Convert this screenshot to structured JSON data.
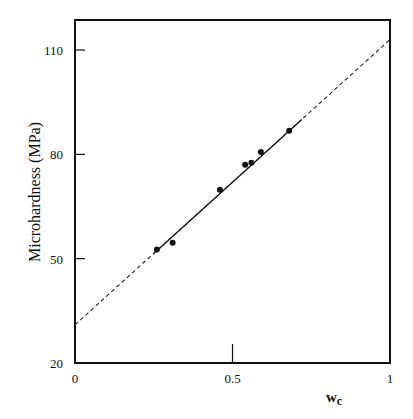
{
  "chart_data": {
    "type": "scatter",
    "title": "",
    "xlabel": "w",
    "xlabel_subscript": "c",
    "ylabel": "Microhardness (MPa)",
    "xlim": [
      0,
      1
    ],
    "ylim": [
      20,
      120
    ],
    "x_ticks": [
      {
        "value": 0,
        "label": "0"
      },
      {
        "value": 0.5,
        "label": "0.5"
      },
      {
        "value": 1,
        "label": "1"
      }
    ],
    "y_ticks": [
      {
        "value": 20,
        "label": "20"
      },
      {
        "value": 50,
        "label": "50"
      },
      {
        "value": 80,
        "label": "80"
      },
      {
        "value": 110,
        "label": "110"
      }
    ],
    "grid": false,
    "legend": null,
    "series": [
      {
        "name": "measured",
        "style": "points",
        "x": [
          0.26,
          0.31,
          0.46,
          0.54,
          0.56,
          0.59,
          0.68
        ],
        "y": [
          52.6,
          54.6,
          69.8,
          77.0,
          77.6,
          80.7,
          86.8
        ]
      },
      {
        "name": "linear fit",
        "style": "solid line",
        "x": [
          0.25,
          0.72
        ],
        "y": [
          51.5,
          90.0
        ]
      },
      {
        "name": "extrapolation",
        "style": "dashed line",
        "x": [
          0,
          1
        ],
        "y": [
          31,
          113
        ]
      }
    ]
  }
}
